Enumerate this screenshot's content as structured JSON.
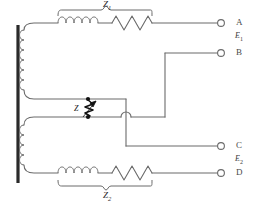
{
  "figure": {
    "kind": "circuit-diagram",
    "width": 257,
    "height": 203,
    "background_color": "#ffffff",
    "wire_color": "#6b6b6b",
    "core_color": "#2a2a2a",
    "component_color": "#111111"
  },
  "labels": {
    "impedance_top": "Z",
    "impedance_top_sub": "1",
    "impedance_bottom": "Z",
    "impedance_bottom_sub": "2",
    "impedance_shunt": "Z"
  },
  "terminals": [
    {
      "id": "A",
      "label": "A",
      "x": 225,
      "y": 28
    },
    {
      "id": "B",
      "label": "B",
      "x": 225,
      "y": 53
    },
    {
      "id": "C",
      "label": "C",
      "x": 225,
      "y": 146
    },
    {
      "id": "D",
      "label": "D",
      "x": 225,
      "y": 170
    }
  ],
  "emf_labels": [
    {
      "symbol": "E",
      "sub": "1",
      "between": "A-B"
    },
    {
      "symbol": "E",
      "sub": "2",
      "between": "C-D"
    }
  ],
  "components": {
    "top_branch": {
      "inductor_turns": 5,
      "resistor_peaks": 5,
      "brace": "above"
    },
    "bottom_branch": {
      "inductor_turns": 5,
      "resistor_peaks": 5,
      "brace": "below"
    },
    "primary_winding_turns": 6,
    "secondary_winding_turns": 4,
    "shunt_impedance": {
      "type": "variable-impedance",
      "arrow": true,
      "node_dots": 2
    }
  }
}
